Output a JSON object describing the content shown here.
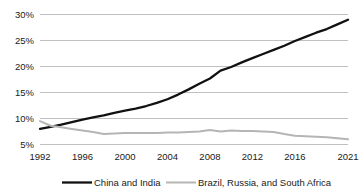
{
  "chart_data": {
    "type": "line",
    "title": "",
    "subtitle": "",
    "xlabel": "",
    "ylabel": "",
    "xlim": [
      1992,
      2021
    ],
    "ylim": [
      5,
      30
    ],
    "grid": true,
    "legend_position": "bottom",
    "y_tick_labels": [
      "30%",
      "25%",
      "20%",
      "15%",
      "10%",
      "5%"
    ],
    "y_tick_values": [
      30,
      25,
      20,
      15,
      10,
      5
    ],
    "x_tick_labels": [
      "1992",
      "1996",
      "2000",
      "2004",
      "2008",
      "2012",
      "2016",
      "2021"
    ],
    "x_tick_values": [
      1992,
      1996,
      2000,
      2004,
      2008,
      2012,
      2016,
      2021
    ],
    "x": [
      1992,
      1993,
      1994,
      1995,
      1996,
      1997,
      1998,
      1999,
      2000,
      2001,
      2002,
      2003,
      2004,
      2005,
      2006,
      2007,
      2008,
      2009,
      2010,
      2011,
      2012,
      2013,
      2014,
      2015,
      2016,
      2017,
      2018,
      2019,
      2020,
      2021
    ],
    "series": [
      {
        "name": "China and India",
        "color": "#111111",
        "values": [
          8.0,
          8.4,
          8.8,
          9.3,
          9.8,
          10.2,
          10.6,
          11.1,
          11.5,
          11.9,
          12.4,
          13.0,
          13.7,
          14.6,
          15.6,
          16.7,
          17.7,
          19.2,
          19.9,
          20.8,
          21.6,
          22.4,
          23.2,
          24.0,
          24.9,
          25.7,
          26.5,
          27.2,
          28.1,
          29.0
        ]
      },
      {
        "name": "Brazil, Russia, and South Africa",
        "color": "#b5b5b5",
        "values": [
          9.5,
          8.6,
          8.3,
          8.0,
          7.7,
          7.4,
          7.0,
          7.1,
          7.2,
          7.2,
          7.2,
          7.2,
          7.3,
          7.3,
          7.4,
          7.5,
          7.8,
          7.5,
          7.7,
          7.6,
          7.6,
          7.5,
          7.4,
          7.0,
          6.7,
          6.6,
          6.5,
          6.4,
          6.2,
          6.0
        ]
      }
    ]
  },
  "legend": {
    "items": [
      {
        "label": "China and India",
        "color": "#111111"
      },
      {
        "label": "Brazil, Russia, and South Africa",
        "color": "#b5b5b5"
      }
    ]
  },
  "axes": {
    "y_labels": [
      "30%",
      "25%",
      "20%",
      "15%",
      "10%",
      "5%"
    ],
    "x_labels": [
      "1992",
      "1996",
      "2000",
      "2004",
      "2008",
      "2012",
      "2016",
      "2021"
    ]
  }
}
